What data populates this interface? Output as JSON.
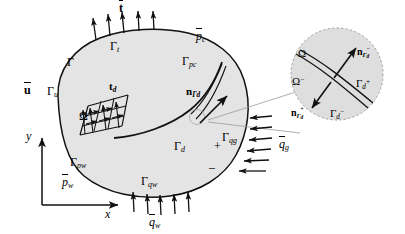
{
  "figure": {
    "domain_symbol": "Ω",
    "boundary_symbol": "Γ",
    "type": "continuum-body-with-cohesive-discontinuity"
  },
  "axes": {
    "x_label": "x",
    "y_label": "y"
  },
  "body_labels": {
    "omega": "Ω",
    "gamma": "Γ",
    "gamma_t": {
      "base": "Γ",
      "sub": "t"
    },
    "gamma_u": {
      "base": "Γ",
      "sub": "u"
    },
    "gamma_pc": {
      "base": "Γ",
      "sub": "pc"
    },
    "gamma_pw": {
      "base": "Γ",
      "sub": "pw"
    },
    "gamma_qw": {
      "base": "Γ",
      "sub": "qw"
    },
    "gamma_qg": {
      "base": "Γ",
      "sub": "qg"
    },
    "gamma_d": {
      "base": "Γ",
      "sub": "d"
    }
  },
  "loads": {
    "traction_top": {
      "symbol": "t",
      "overbar": true
    },
    "displacement_left": {
      "symbol": "u",
      "overbar": true
    },
    "pressure_c": {
      "symbol": "p",
      "sub": "c",
      "overbar": true
    },
    "pressure_w": {
      "symbol": "p",
      "sub": "w",
      "overbar": true
    },
    "flux_w": {
      "symbol": "q",
      "sub": "w",
      "overbar": true
    },
    "flux_g": {
      "symbol": "q",
      "sub": "g",
      "overbar": true
    },
    "cohesive_traction": {
      "symbol": "t",
      "sub": "d"
    },
    "normal_gamma_d": {
      "symbol": "n",
      "sub": "Γd"
    }
  },
  "signs": {
    "plus": "+",
    "minus": "−"
  },
  "inset": {
    "omega_plus": "Ω",
    "omega_minus": {
      "base": "Ω",
      "sup": "−"
    },
    "n_minus": {
      "base": "n",
      "sub": "Γ",
      "subsub": "d",
      "sup": "−"
    },
    "n_plus": {
      "base": "n",
      "sub": "Γ",
      "subsub": "d",
      "sup": "+"
    },
    "gamma_d_plus": {
      "base": "Γ",
      "sub": "d",
      "sup": "+"
    },
    "gamma_d_minus": {
      "base": "Γ",
      "sub": "d",
      "sup": "−"
    }
  },
  "arrow_counts": {
    "traction_top": 5,
    "flux_bottom": 5,
    "flux_right": 6,
    "cohesive_rows": 4,
    "cohesive_cols": 4
  },
  "colors": {
    "body_fill": "#e4e4e4",
    "inset_fill": "#dedede",
    "stroke": "#111111",
    "leader": "#999999"
  }
}
